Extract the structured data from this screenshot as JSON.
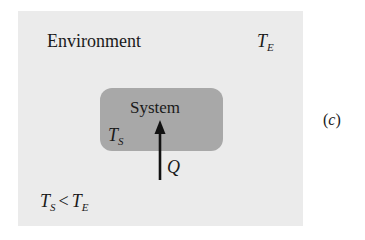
{
  "diagram": {
    "environment": {
      "label": "Environment",
      "temp_symbol": "T",
      "temp_subscript": "E",
      "fill_color": "#ebebeb"
    },
    "system": {
      "label": "System",
      "temp_symbol": "T",
      "temp_subscript": "S",
      "fill_color": "#a8a8a8"
    },
    "heat_flow": {
      "label": "Q",
      "direction": "up-into-system",
      "arrow_icon": "arrow-up-icon"
    },
    "condition": {
      "left_symbol": "T",
      "left_subscript": "S",
      "operator": "<",
      "right_symbol": "T",
      "right_subscript": "E"
    },
    "panel_label": {
      "open": "(",
      "letter": "c",
      "close": ")"
    }
  }
}
